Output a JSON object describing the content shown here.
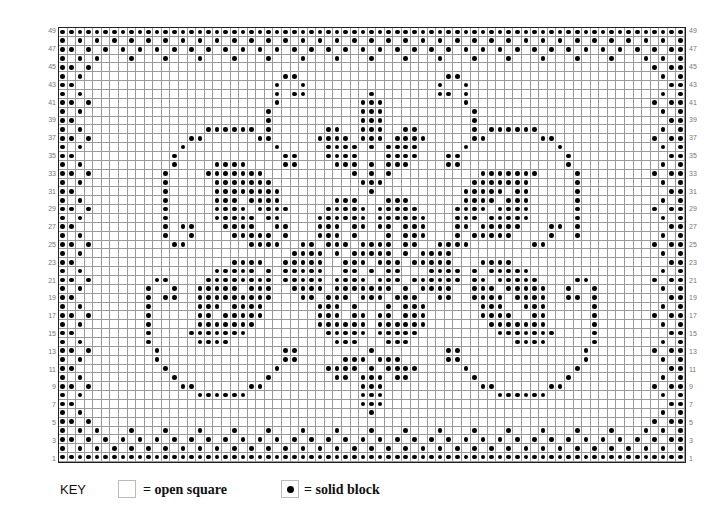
{
  "chart": {
    "columns": 73,
    "rows": 49,
    "row_labels_odd_only": true,
    "dots": {
      "49": "all",
      "48": [
        1,
        3,
        5,
        7,
        9,
        11,
        13,
        15,
        17,
        19,
        21,
        23,
        25,
        27,
        29,
        31,
        33,
        35,
        37,
        39,
        41,
        43,
        45,
        47,
        49,
        51,
        53,
        55,
        57,
        59,
        61,
        63,
        65,
        67,
        69,
        71,
        73
      ],
      "47": [
        1,
        2,
        4,
        6,
        8,
        10,
        12,
        14,
        16,
        18,
        20,
        22,
        24,
        26,
        28,
        30,
        32,
        34,
        36,
        38,
        40,
        42,
        44,
        46,
        48,
        50,
        52,
        54,
        56,
        58,
        60,
        62,
        64,
        66,
        68,
        70,
        72,
        73
      ],
      "46": [
        1,
        3,
        5,
        9,
        13,
        17,
        21,
        25,
        29,
        33,
        37,
        41,
        45,
        49,
        53,
        57,
        61,
        65,
        69,
        71,
        73
      ],
      "45": [
        1,
        2,
        4,
        70,
        72,
        73
      ],
      "44": [
        1,
        3,
        27,
        28,
        46,
        47,
        71,
        73
      ],
      "43": [
        1,
        2,
        26,
        29,
        45,
        48,
        72,
        73
      ],
      "42": [
        1,
        3,
        26,
        28,
        29,
        37,
        45,
        46,
        48,
        71,
        73
      ],
      "41": [
        1,
        2,
        4,
        26,
        36,
        37,
        38,
        48,
        70,
        72,
        73
      ],
      "40": [
        1,
        3,
        25,
        36,
        37,
        38,
        49,
        71,
        73
      ],
      "39": [
        1,
        2,
        25,
        36,
        37,
        38,
        49,
        72,
        73
      ],
      "38": [
        1,
        3,
        18,
        19,
        20,
        21,
        22,
        23,
        25,
        32,
        33,
        36,
        37,
        38,
        41,
        42,
        49,
        51,
        52,
        53,
        54,
        55,
        56,
        71,
        73
      ],
      "37": [
        1,
        2,
        4,
        16,
        17,
        24,
        25,
        31,
        32,
        33,
        34,
        36,
        37,
        38,
        40,
        41,
        42,
        43,
        49,
        50,
        57,
        58,
        70,
        72,
        73
      ],
      "36": [
        1,
        3,
        15,
        26,
        32,
        33,
        34,
        35,
        37,
        39,
        40,
        41,
        42,
        48,
        59,
        71,
        73
      ],
      "35": [
        1,
        2,
        14,
        27,
        28,
        32,
        33,
        34,
        35,
        39,
        40,
        41,
        42,
        46,
        47,
        60,
        72,
        73
      ],
      "34": [
        1,
        3,
        14,
        19,
        20,
        21,
        22,
        27,
        28,
        33,
        34,
        35,
        37,
        39,
        40,
        41,
        46,
        47,
        60,
        71,
        73
      ],
      "33": [
        1,
        2,
        4,
        13,
        18,
        19,
        20,
        21,
        22,
        23,
        24,
        35,
        37,
        39,
        50,
        51,
        52,
        53,
        54,
        55,
        56,
        61,
        70,
        72,
        73
      ],
      "32": [
        1,
        3,
        13,
        19,
        20,
        21,
        22,
        23,
        24,
        25,
        36,
        37,
        38,
        49,
        50,
        51,
        52,
        53,
        54,
        55,
        61,
        71,
        73
      ],
      "31": [
        1,
        2,
        13,
        19,
        20,
        21,
        22,
        23,
        24,
        25,
        26,
        37,
        48,
        49,
        50,
        51,
        52,
        54,
        55,
        61,
        72,
        73
      ],
      "30": [
        1,
        3,
        13,
        19,
        20,
        21,
        23,
        24,
        25,
        26,
        33,
        34,
        35,
        39,
        40,
        41,
        48,
        49,
        50,
        51,
        53,
        54,
        55,
        61,
        71,
        73
      ],
      "29": [
        1,
        2,
        4,
        13,
        19,
        20,
        21,
        22,
        24,
        25,
        26,
        27,
        32,
        33,
        34,
        35,
        36,
        38,
        39,
        40,
        41,
        42,
        47,
        48,
        49,
        50,
        52,
        53,
        54,
        55,
        61,
        70,
        72,
        73
      ],
      "28": [
        1,
        3,
        13,
        19,
        20,
        21,
        22,
        23,
        25,
        26,
        31,
        32,
        33,
        34,
        35,
        36,
        38,
        39,
        40,
        41,
        42,
        43,
        47,
        48,
        49,
        51,
        52,
        53,
        54,
        55,
        61,
        71,
        73
      ],
      "27": [
        1,
        2,
        13,
        15,
        16,
        20,
        21,
        22,
        23,
        26,
        27,
        31,
        32,
        33,
        35,
        36,
        38,
        39,
        41,
        42,
        43,
        47,
        48,
        50,
        51,
        52,
        53,
        54,
        58,
        59,
        61,
        72,
        73
      ],
      "26": [
        1,
        3,
        13,
        16,
        21,
        22,
        23,
        24,
        25,
        27,
        31,
        32,
        33,
        35,
        39,
        41,
        42,
        43,
        47,
        49,
        50,
        51,
        52,
        53,
        58,
        61,
        71,
        73
      ],
      "25": [
        1,
        2,
        4,
        14,
        15,
        23,
        24,
        25,
        26,
        29,
        30,
        32,
        33,
        34,
        36,
        37,
        38,
        39,
        41,
        42,
        45,
        46,
        47,
        48,
        56,
        57,
        70,
        72,
        73
      ],
      "24": [
        1,
        3,
        28,
        29,
        30,
        31,
        33,
        35,
        36,
        37,
        38,
        39,
        41,
        43,
        44,
        45,
        46,
        71,
        73
      ],
      "23": [
        1,
        2,
        21,
        22,
        23,
        24,
        27,
        28,
        29,
        30,
        31,
        34,
        35,
        36,
        38,
        39,
        40,
        42,
        43,
        44,
        45,
        46,
        50,
        51,
        52,
        53,
        72,
        73
      ],
      "22": [
        1,
        3,
        19,
        20,
        21,
        22,
        23,
        25,
        27,
        28,
        29,
        30,
        31,
        34,
        35,
        37,
        39,
        40,
        44,
        45,
        46,
        47,
        49,
        51,
        52,
        53,
        54,
        55,
        71,
        73
      ],
      "21": [
        1,
        2,
        4,
        12,
        13,
        18,
        19,
        20,
        21,
        22,
        23,
        24,
        25,
        27,
        28,
        29,
        30,
        31,
        33,
        34,
        35,
        36,
        38,
        39,
        40,
        42,
        43,
        44,
        45,
        46,
        47,
        49,
        50,
        52,
        53,
        54,
        55,
        56,
        61,
        62,
        70,
        72,
        73
      ],
      "20": [
        1,
        3,
        11,
        14,
        17,
        18,
        19,
        20,
        21,
        23,
        24,
        25,
        28,
        29,
        30,
        31,
        33,
        34,
        35,
        36,
        37,
        38,
        39,
        41,
        43,
        44,
        45,
        46,
        49,
        50,
        51,
        53,
        54,
        55,
        56,
        57,
        60,
        63,
        71,
        73
      ],
      "19": [
        1,
        2,
        11,
        13,
        14,
        17,
        18,
        19,
        20,
        21,
        22,
        23,
        24,
        25,
        29,
        30,
        32,
        33,
        34,
        36,
        37,
        38,
        40,
        41,
        42,
        45,
        46,
        49,
        50,
        51,
        52,
        54,
        55,
        56,
        57,
        60,
        61,
        63,
        72,
        73
      ],
      "18": [
        1,
        3,
        11,
        17,
        18,
        19,
        21,
        22,
        23,
        24,
        31,
        32,
        33,
        35,
        39,
        41,
        42,
        43,
        50,
        51,
        52,
        55,
        56,
        57,
        63,
        71,
        73
      ],
      "17": [
        1,
        2,
        4,
        11,
        17,
        18,
        20,
        21,
        22,
        23,
        24,
        31,
        32,
        33,
        35,
        36,
        38,
        39,
        41,
        42,
        43,
        50,
        51,
        52,
        53,
        56,
        57,
        63,
        70,
        72,
        73
      ],
      "16": [
        1,
        3,
        11,
        17,
        18,
        19,
        20,
        21,
        22,
        23,
        31,
        32,
        33,
        34,
        35,
        36,
        38,
        39,
        40,
        41,
        42,
        43,
        51,
        52,
        53,
        54,
        55,
        56,
        57,
        63,
        71,
        73
      ],
      "15": [
        1,
        2,
        11,
        16,
        17,
        18,
        19,
        20,
        21,
        22,
        32,
        33,
        34,
        35,
        36,
        38,
        39,
        40,
        41,
        42,
        52,
        53,
        54,
        55,
        56,
        57,
        58,
        63,
        72,
        73
      ],
      "14": [
        1,
        3,
        11,
        17,
        18,
        19,
        20,
        33,
        34,
        35,
        39,
        40,
        41,
        54,
        55,
        56,
        57,
        63,
        71,
        73
      ],
      "13": [
        1,
        2,
        4,
        12,
        27,
        28,
        37,
        46,
        47,
        62,
        70,
        72,
        73
      ],
      "12": [
        1,
        3,
        12,
        27,
        28,
        34,
        35,
        36,
        38,
        39,
        40,
        46,
        47,
        62,
        71,
        73
      ],
      "11": [
        1,
        2,
        13,
        26,
        32,
        33,
        34,
        35,
        37,
        39,
        40,
        41,
        42,
        48,
        61,
        72,
        73
      ],
      "10": [
        1,
        3,
        14,
        25,
        33,
        34,
        36,
        37,
        38,
        40,
        41,
        49,
        60,
        71,
        73
      ],
      "9": [
        1,
        2,
        4,
        15,
        16,
        23,
        24,
        36,
        37,
        38,
        50,
        51,
        58,
        59,
        70,
        72,
        73
      ],
      "8": [
        1,
        3,
        17,
        18,
        19,
        20,
        21,
        22,
        36,
        37,
        38,
        52,
        53,
        54,
        55,
        56,
        57,
        71,
        73
      ],
      "7": [
        1,
        2,
        36,
        37,
        38,
        72,
        73
      ],
      "6": [
        1,
        3,
        37,
        71,
        73
      ],
      "5": [
        1,
        2,
        4,
        70,
        72,
        73
      ],
      "4": [
        1,
        3,
        5,
        9,
        13,
        17,
        21,
        25,
        29,
        33,
        37,
        41,
        45,
        49,
        53,
        57,
        61,
        65,
        69,
        71,
        73
      ],
      "3": [
        1,
        2,
        4,
        6,
        8,
        10,
        12,
        14,
        16,
        18,
        20,
        22,
        24,
        26,
        28,
        30,
        32,
        34,
        36,
        38,
        40,
        42,
        44,
        46,
        48,
        50,
        52,
        54,
        56,
        58,
        60,
        62,
        64,
        66,
        68,
        70,
        72,
        73
      ],
      "2": [
        1,
        3,
        5,
        7,
        9,
        11,
        13,
        15,
        17,
        19,
        21,
        23,
        25,
        27,
        29,
        31,
        33,
        35,
        37,
        39,
        41,
        43,
        45,
        47,
        49,
        51,
        53,
        55,
        57,
        59,
        61,
        63,
        65,
        67,
        69,
        71,
        73
      ],
      "1": "all"
    }
  },
  "row_labels": [
    "49",
    "47",
    "45",
    "43",
    "41",
    "39",
    "37",
    "35",
    "33",
    "31",
    "29",
    "27",
    "25",
    "23",
    "21",
    "19",
    "17",
    "15",
    "13",
    "11",
    "9",
    "7",
    "5",
    "3",
    "1"
  ],
  "key": {
    "title": "KEY",
    "open_label": "= open square",
    "solid_label": "= solid block"
  }
}
